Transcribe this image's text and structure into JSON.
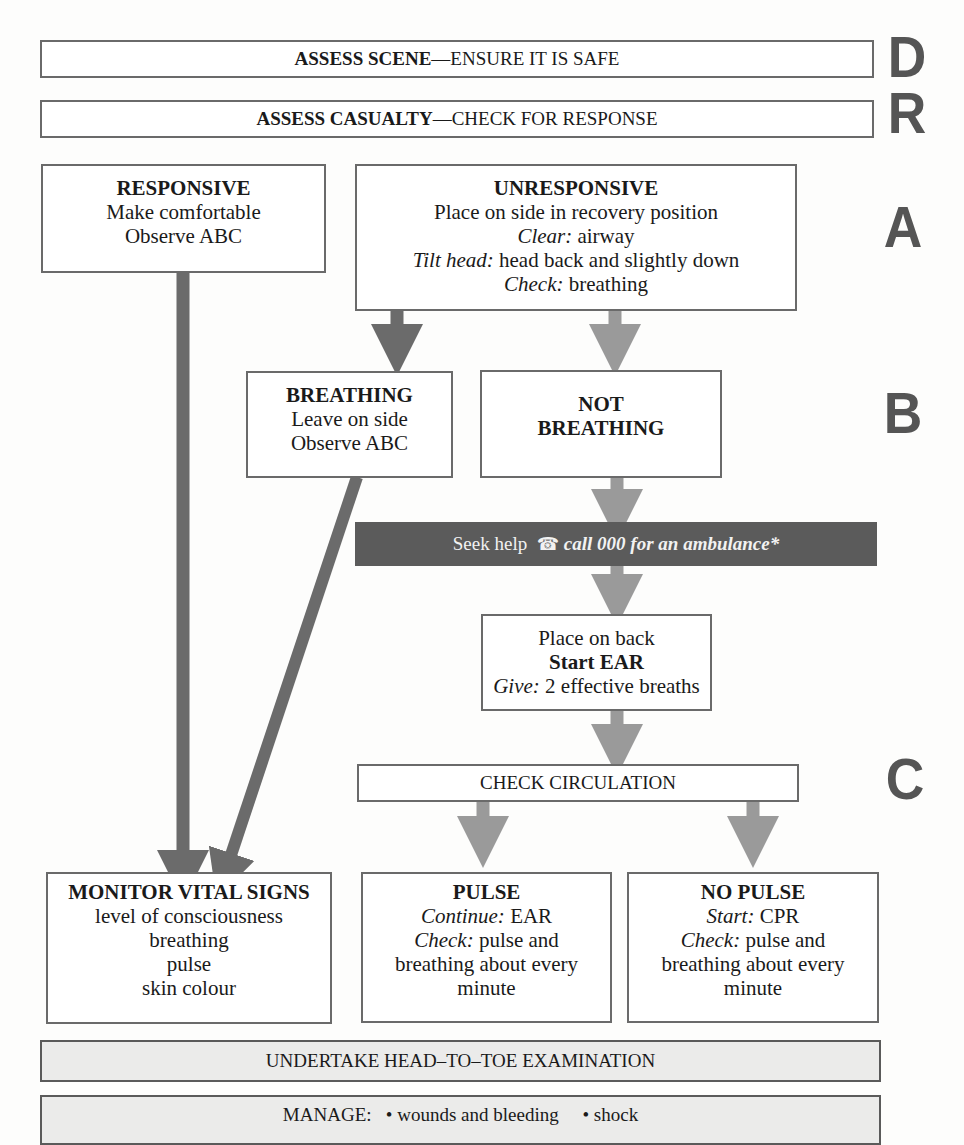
{
  "steps": {
    "danger": {
      "letter": "D",
      "bold": "ASSESS SCENE",
      "rest": "—ENSURE IT IS SAFE"
    },
    "response": {
      "letter": "R",
      "bold": "ASSESS CASUALTY",
      "rest": "—CHECK FOR RESPONSE"
    },
    "airway_letter": "A",
    "breathing_letter": "B",
    "circulation_letter": "C"
  },
  "responsive": {
    "title": "RESPONSIVE",
    "lines": [
      "Make comfortable",
      "Observe ABC"
    ]
  },
  "unresponsive": {
    "title": "UNRESPONSIVE",
    "line1": "Place on side in recovery position",
    "clear_label": "Clear:",
    "clear_value": " airway",
    "tilt_label": "Tilt head:",
    "tilt_value": " head back and slightly down",
    "check_label": "Check:",
    "check_value": " breathing"
  },
  "breathing": {
    "title": "BREATHING",
    "lines": [
      "Leave on side",
      "Observe ABC"
    ]
  },
  "not_breathing": {
    "line1": "NOT",
    "line2": "BREATHING"
  },
  "seek_help": {
    "label": "Seek help",
    "icon": "telephone-icon",
    "icon_glyph": "☎",
    "call_text": "call 000 for an ambulance*"
  },
  "ear": {
    "line1": "Place on back",
    "title": "Start EAR",
    "give_label": "Give:",
    "give_value": " 2 effective breaths"
  },
  "check_circulation": "CHECK CIRCULATION",
  "monitor": {
    "title": "MONITOR VITAL SIGNS",
    "lines": [
      "level of consciousness",
      "breathing",
      "pulse",
      "skin colour"
    ]
  },
  "pulse": {
    "title": "PULSE",
    "continue_label": "Continue:",
    "continue_value": " EAR",
    "check_label": "Check:",
    "check_value": " pulse and",
    "line3": "breathing about every",
    "line4": "minute"
  },
  "no_pulse": {
    "title": "NO PULSE",
    "start_label": "Start:",
    "start_value": " CPR",
    "check_label": "Check:",
    "check_value": " pulse and",
    "line3": "breathing about every",
    "line4": "minute"
  },
  "head_to_toe": "UNDERTAKE HEAD–TO–TOE EXAMINATION",
  "manage": {
    "label": "MANAGE:",
    "items": [
      "• wounds and bleeding",
      "• shock"
    ]
  },
  "colors": {
    "arrow_dark": "#6b6b6b",
    "arrow_light": "#9a9a9a",
    "banner": "#5b5b5b",
    "letters": "#555555",
    "grey_box": "#ebebea"
  }
}
